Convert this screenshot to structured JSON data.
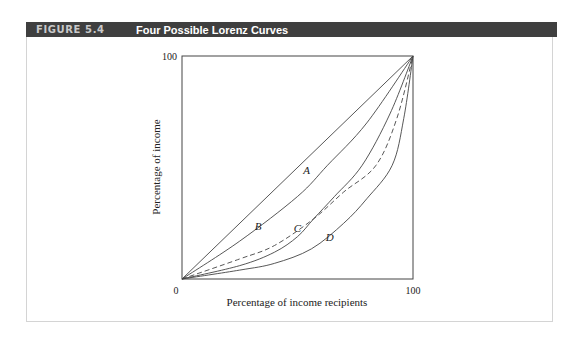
{
  "figure": {
    "number": "FIGURE 5.4",
    "title": "Four Possible Lorenz Curves"
  },
  "colors": {
    "header_bg": "#3f3f3f",
    "header_number": "#c9c9c9",
    "header_title": "#ffffff",
    "line": "#444444",
    "frame": "#d4d4d4"
  },
  "chart_data": {
    "type": "line",
    "title": "Four Possible Lorenz Curves",
    "xlabel": "Percentage of income recipients",
    "ylabel": "Percentage of income",
    "xlim": [
      0,
      100
    ],
    "ylim": [
      0,
      100
    ],
    "x_ticks": [
      "0",
      "100"
    ],
    "y_ticks": [
      "100"
    ],
    "origin_label": "0",
    "grid": false,
    "legend": "none (curves labeled inline)",
    "series": [
      {
        "name": "Line of equality",
        "style": "solid",
        "label": "",
        "points": [
          [
            0,
            0
          ],
          [
            100,
            100
          ]
        ]
      },
      {
        "name": "A",
        "style": "solid",
        "label": "A",
        "label_pos": [
          54,
          47
        ],
        "points": [
          [
            0,
            0
          ],
          [
            25,
            17
          ],
          [
            50,
            37
          ],
          [
            63,
            51
          ],
          [
            80,
            70
          ],
          [
            100,
            100
          ]
        ]
      },
      {
        "name": "B",
        "style": "dashed",
        "label": "B",
        "label_pos": [
          33,
          22
        ],
        "points": [
          [
            0,
            0
          ],
          [
            25,
            9
          ],
          [
            40,
            15
          ],
          [
            57,
            27
          ],
          [
            70,
            39
          ],
          [
            84,
            51
          ],
          [
            93,
            72
          ],
          [
            100,
            100
          ]
        ]
      },
      {
        "name": "C",
        "style": "solid",
        "label": "C",
        "label_pos": [
          50,
          21
        ],
        "points": [
          [
            0,
            0
          ],
          [
            25,
            6
          ],
          [
            40,
            12
          ],
          [
            50,
            19
          ],
          [
            57,
            27
          ],
          [
            66,
            37
          ],
          [
            78,
            51
          ],
          [
            90,
            74
          ],
          [
            100,
            100
          ]
        ]
      },
      {
        "name": "D",
        "style": "solid",
        "label": "D",
        "label_pos": [
          64,
          17
        ],
        "points": [
          [
            0,
            0
          ],
          [
            25,
            4
          ],
          [
            40,
            7
          ],
          [
            56,
            13.5
          ],
          [
            70,
            25
          ],
          [
            80,
            36
          ],
          [
            91,
            51
          ],
          [
            96,
            72
          ],
          [
            100,
            100
          ]
        ]
      }
    ]
  }
}
